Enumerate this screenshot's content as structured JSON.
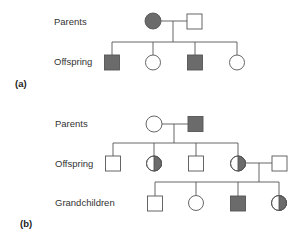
{
  "colors": {
    "affected": "#6b6b6b",
    "stroke": "#555555",
    "background": "#ffffff"
  },
  "panels": [
    {
      "id": "a",
      "label": "(a)",
      "generations": [
        {
          "label": "Parents",
          "individuals": [
            {
              "sex": "female",
              "status": "affected"
            },
            {
              "sex": "male",
              "status": "unaffected"
            }
          ]
        },
        {
          "label": "Offspring",
          "individuals": [
            {
              "sex": "male",
              "status": "affected"
            },
            {
              "sex": "female",
              "status": "unaffected"
            },
            {
              "sex": "male",
              "status": "affected"
            },
            {
              "sex": "female",
              "status": "unaffected"
            }
          ]
        }
      ]
    },
    {
      "id": "b",
      "label": "(b)",
      "generations": [
        {
          "label": "Parents",
          "individuals": [
            {
              "sex": "female",
              "status": "unaffected"
            },
            {
              "sex": "male",
              "status": "affected"
            }
          ]
        },
        {
          "label": "Offspring",
          "individuals": [
            {
              "sex": "male",
              "status": "unaffected"
            },
            {
              "sex": "female",
              "status": "carrier"
            },
            {
              "sex": "male",
              "status": "unaffected"
            },
            {
              "sex": "female",
              "status": "carrier"
            },
            {
              "sex": "male",
              "status": "unaffected",
              "note": "spouse"
            }
          ]
        },
        {
          "label": "Grandchildren",
          "individuals": [
            {
              "sex": "male",
              "status": "unaffected"
            },
            {
              "sex": "female",
              "status": "unaffected"
            },
            {
              "sex": "male",
              "status": "affected"
            },
            {
              "sex": "female",
              "status": "carrier"
            }
          ]
        }
      ]
    }
  ]
}
